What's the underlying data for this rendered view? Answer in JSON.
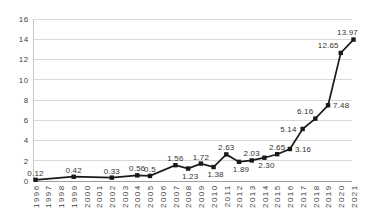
{
  "chart_data": {
    "type": "line",
    "legend": "none",
    "grid": "horizontal",
    "x_categories": [
      "1996",
      "1997",
      "1998",
      "1999",
      "2000",
      "2001",
      "2002",
      "2003",
      "2004",
      "2005",
      "2006",
      "2007",
      "2008",
      "2009",
      "2010",
      "2011",
      "2012",
      "2013",
      "2014",
      "2015",
      "2016",
      "2017",
      "2018",
      "2019",
      "2020",
      "2021"
    ],
    "ylim": [
      0,
      16
    ],
    "y_ticks": [
      0,
      2,
      4,
      6,
      8,
      10,
      12,
      14,
      16
    ],
    "y_tick_labels": [
      "0",
      "2",
      "4",
      "6",
      "8",
      "10",
      "12",
      "14",
      "16"
    ],
    "series": [
      {
        "name": "series-1",
        "color": "#1a1a1a",
        "marker": "square",
        "points": [
          {
            "x": "1996",
            "y": 0.12,
            "label": "0.12",
            "label_pos": "above"
          },
          {
            "x": "1999",
            "y": 0.42,
            "label": "0.42",
            "label_pos": "above"
          },
          {
            "x": "2002",
            "y": 0.33,
            "label": "0.33",
            "label_pos": "above"
          },
          {
            "x": "2004",
            "y": 0.56,
            "label": "0.56",
            "label_pos": "above"
          },
          {
            "x": "2005",
            "y": 0.5,
            "label": "0.5",
            "label_pos": "above"
          },
          {
            "x": "2007",
            "y": 1.56,
            "label": "1.56",
            "label_pos": "above"
          },
          {
            "x": "2008",
            "y": 1.23,
            "label": "1.23",
            "label_pos": "below"
          },
          {
            "x": "2009",
            "y": 1.72,
            "label": "1.72",
            "label_pos": "above"
          },
          {
            "x": "2010",
            "y": 1.38,
            "label": "1.38",
            "label_pos": "below"
          },
          {
            "x": "2011",
            "y": 2.63,
            "label": "2.63",
            "label_pos": "above"
          },
          {
            "x": "2012",
            "y": 1.89,
            "label": "1.89",
            "label_pos": "below"
          },
          {
            "x": "2013",
            "y": 2.03,
            "label": "2.03",
            "label_pos": "above"
          },
          {
            "x": "2014",
            "y": 2.3,
            "label": "2.30",
            "label_pos": "below"
          },
          {
            "x": "2015",
            "y": 2.65,
            "label": "2.65",
            "label_pos": "above"
          },
          {
            "x": "2016",
            "y": 3.16,
            "label": "3.16",
            "label_pos": "right"
          },
          {
            "x": "2017",
            "y": 5.14,
            "label": "5.14",
            "label_pos": "left"
          },
          {
            "x": "2018",
            "y": 6.16,
            "label": "6.16",
            "label_pos": "above-left"
          },
          {
            "x": "2019",
            "y": 7.48,
            "label": "7.48",
            "label_pos": "right"
          },
          {
            "x": "2020",
            "y": 12.65,
            "label": "12.65",
            "label_pos": "above-left"
          },
          {
            "x": "2021",
            "y": 13.97,
            "label": "13.97",
            "label_pos": "above-shift"
          }
        ]
      }
    ],
    "colors": {
      "background": "#ffffff",
      "grid": "#d9d9d9",
      "axis": "#9e9e9e",
      "axis_light": "#c6c6c6",
      "tick_text": "#3f3f3f",
      "data_label_text": "#333333"
    }
  }
}
